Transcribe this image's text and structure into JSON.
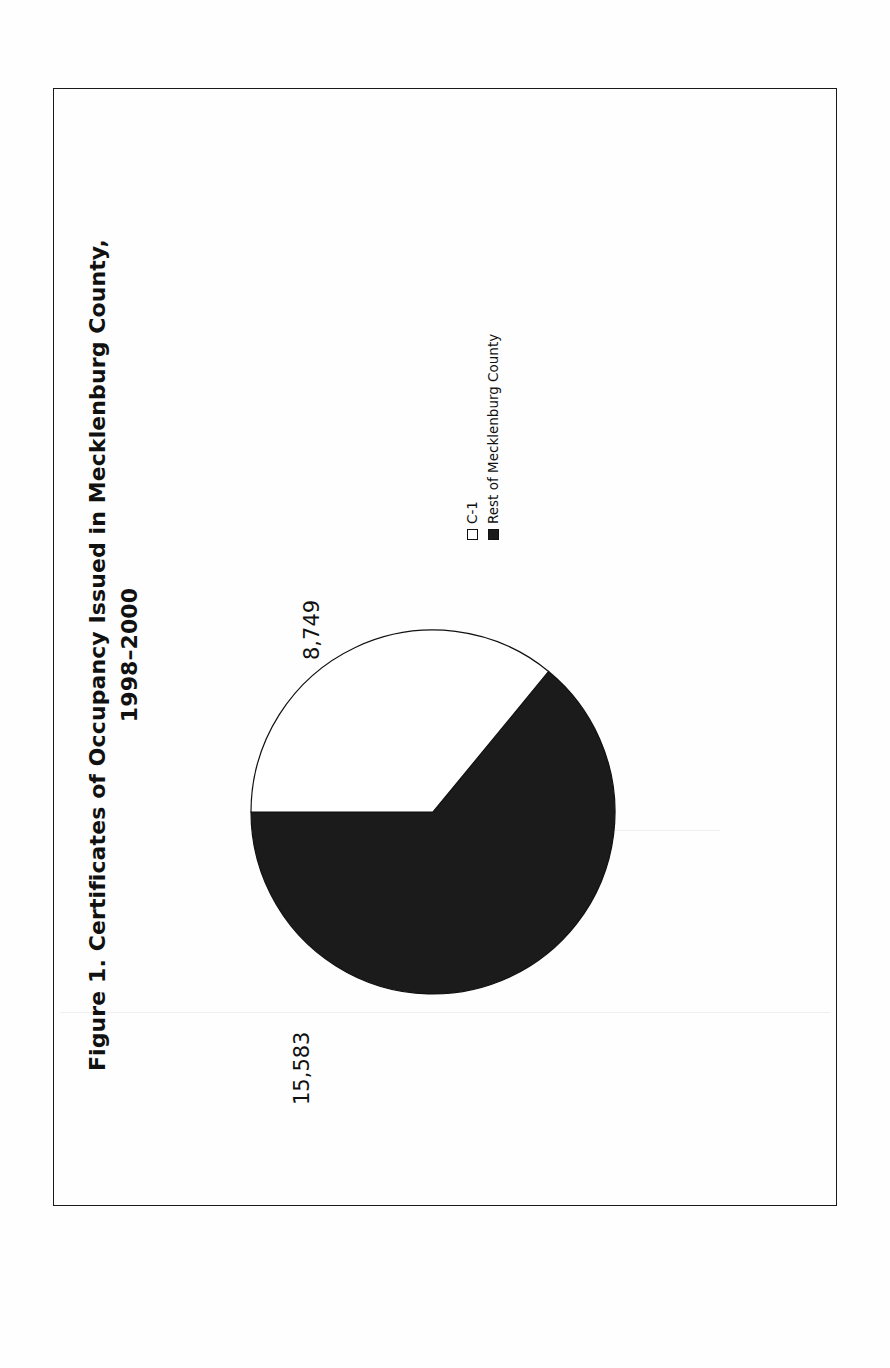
{
  "figure": {
    "title_line1": "Figure 1. Certificates of Occupancy Issued in Mecklenburg County,",
    "title_line2": "1998–2000"
  },
  "legend": {
    "items": [
      {
        "label": "C-1",
        "swatch": "open-square",
        "color": "#ffffff"
      },
      {
        "label": "Rest of Mecklenburg County",
        "swatch": "filled-square",
        "color": "#1b1b1b"
      }
    ]
  },
  "labels": {
    "c1_value": "8,749",
    "rest_value": "15,583"
  },
  "chart_data": {
    "type": "pie",
    "title": "Figure 1. Certificates of Occupancy Issued in Mecklenburg County, 1998–2000",
    "categories": [
      "C-1",
      "Rest of Mecklenburg County"
    ],
    "values": [
      8749,
      15583
    ],
    "value_labels": [
      "8,749",
      "15,583"
    ],
    "colors": [
      "#ffffff",
      "#1b1b1b"
    ],
    "total": 24332,
    "percentages": [
      35.96,
      64.04
    ],
    "legend_position": "right",
    "grid": false,
    "rotation_degrees": -90
  },
  "ghost_text": {
    "a": "the provisions of",
    "b": "Section",
    "c": "of Mecklenburg County",
    "d": "zoning ordinance"
  }
}
